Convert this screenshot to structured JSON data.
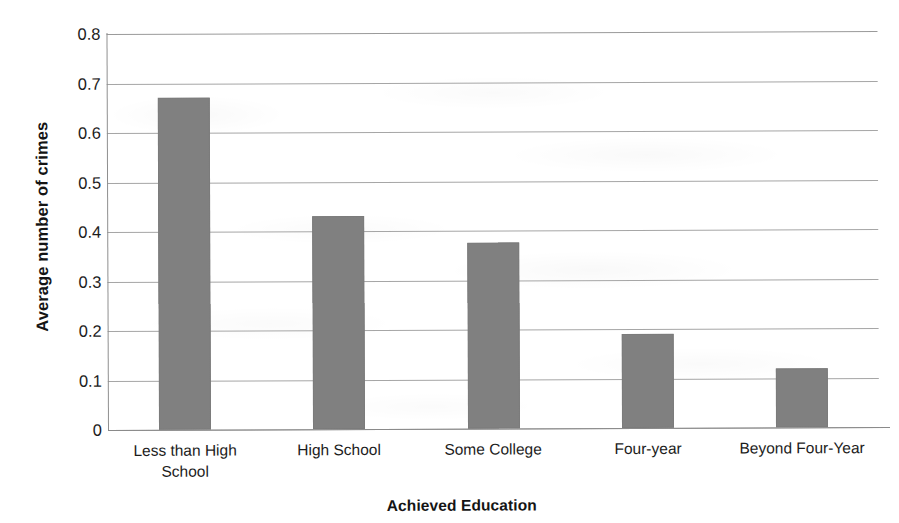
{
  "chart_data": {
    "type": "bar",
    "title": "",
    "xlabel": "Achieved Education",
    "ylabel": "Average number of crimes",
    "categories": [
      "Less than High School",
      "High School",
      "Some College",
      "Four-year",
      "Beyond Four-Year"
    ],
    "category_lines": [
      [
        "Less than High",
        "School"
      ],
      [
        "High School"
      ],
      [
        "Some College"
      ],
      [
        "Four-year"
      ],
      [
        "Beyond Four-Year"
      ]
    ],
    "values": [
      0.67,
      0.43,
      0.375,
      0.19,
      0.12
    ],
    "ylim": [
      0,
      0.8
    ],
    "ytick_labels": [
      "0.8",
      "0.7",
      "0.6",
      "0.5",
      "0.4",
      "0.3",
      "0.2",
      "0.1",
      "0"
    ],
    "ytick_values": [
      0.8,
      0.7,
      0.6,
      0.5,
      0.4,
      0.3,
      0.2,
      0.1,
      0
    ],
    "grid": "horizontal",
    "legend": "none",
    "bar_color": "#808080",
    "gridline_color": "#a6a6a6",
    "axis_color": "#8a8a8a",
    "background": "#ffffff"
  }
}
